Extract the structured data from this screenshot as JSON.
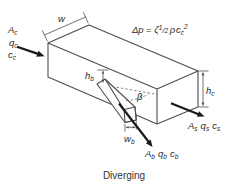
{
  "caption": "Diverging",
  "pressure_formula": {
    "delta_p": "Δp",
    "equals": "=",
    "zeta": "ζ",
    "half_numerator": "1",
    "half_slash": "/",
    "half_denominator": "2",
    "rho": "ρ",
    "velocity": "c",
    "velocity_subscript": "c",
    "exponent": "2"
  },
  "inlet_common": {
    "area": {
      "main": "A",
      "sub": "c"
    },
    "flow": {
      "main": "q",
      "sub": "c"
    },
    "velocity": {
      "main": "c",
      "sub": "c"
    }
  },
  "outlet_straight": {
    "area": {
      "main": "A",
      "sub": "s"
    },
    "flow": {
      "main": "q",
      "sub": "s"
    },
    "velocity": {
      "main": "c",
      "sub": "s"
    }
  },
  "outlet_branch": {
    "area": {
      "main": "A",
      "sub": "b"
    },
    "flow": {
      "main": "q",
      "sub": "b"
    },
    "velocity": {
      "main": "c",
      "sub": "b"
    }
  },
  "dimensions": {
    "duct_width": {
      "main": "w"
    },
    "duct_height": {
      "main": "h",
      "sub": "c"
    },
    "branch_opening_height": {
      "main": "h",
      "sub": "b"
    },
    "branch_width": {
      "main": "w",
      "sub": "b"
    },
    "branch_angle": "β"
  },
  "colors": {
    "background": "#ffffff",
    "line": "#4e4e4e",
    "flow_arrow": "#1a1a1a",
    "text": "#2b2b2b"
  }
}
